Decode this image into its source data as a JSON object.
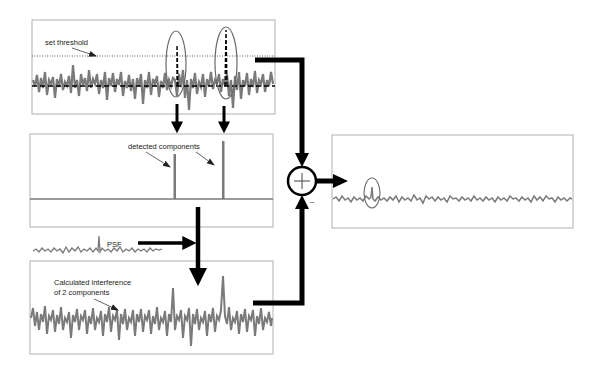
{
  "diagram": {
    "type": "signal-processing-flow",
    "panels": [
      {
        "id": "input-signal",
        "label": "set threshold",
        "description": "noisy signal with dotted threshold line and two circled peaks exceeding it"
      },
      {
        "id": "detected-components",
        "label": "detected components",
        "description": "two isolated spikes on a flat baseline"
      },
      {
        "id": "psf",
        "label": "PSF",
        "description": "point spread function trace"
      },
      {
        "id": "interference",
        "label_line1": "Calculated interference",
        "label_line2": "of 2 components",
        "description": "convolution of detected components with PSF"
      },
      {
        "id": "output",
        "description": "residual signal with a small circled peak"
      }
    ],
    "junction": {
      "symbol": "+",
      "minus_sign": "–"
    },
    "colors": {
      "signal": "#7a7a7a",
      "arrow": "#000000",
      "border": "#b0b0b0",
      "ellipse": "#6a6a6a"
    }
  }
}
